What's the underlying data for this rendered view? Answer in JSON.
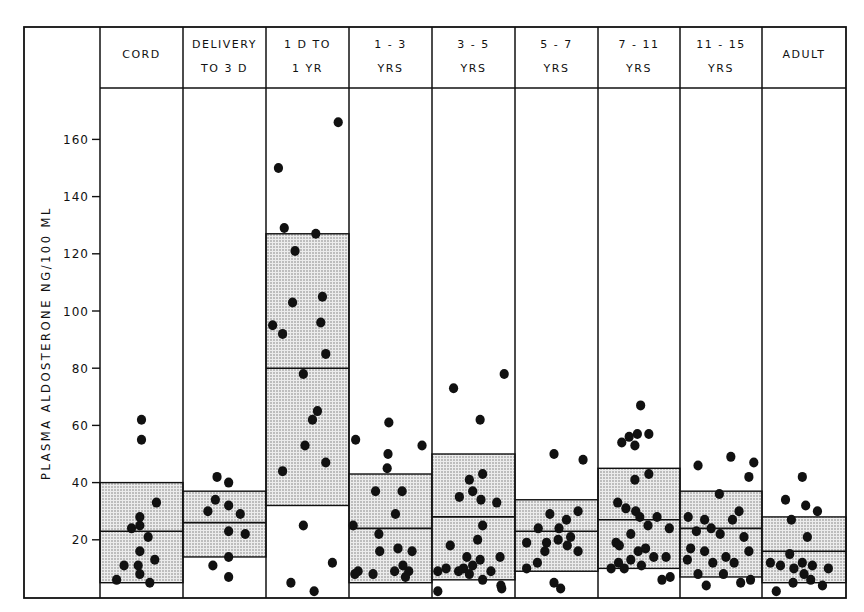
{
  "chart_data": {
    "type": "scatter",
    "title": "",
    "xlabel": "",
    "ylabel": "PLASMA  ALDOSTERONE  NG/100 ML",
    "ylim": [
      0,
      175
    ],
    "yticks": [
      20,
      40,
      60,
      80,
      100,
      120,
      140,
      160
    ],
    "grid": false,
    "legend": null,
    "categories": [
      {
        "line1": "CORD",
        "line2": ""
      },
      {
        "line1": "DELIVERY",
        "line2": "TO 3 D"
      },
      {
        "line1": "1 D  TO",
        "line2": "1 YR"
      },
      {
        "line1": "1 - 3",
        "line2": "YRS"
      },
      {
        "line1": "3 - 5",
        "line2": "YRS"
      },
      {
        "line1": "5 - 7",
        "line2": "YRS"
      },
      {
        "line1": "7 - 11",
        "line2": "YRS"
      },
      {
        "line1": "11 - 15",
        "line2": "YRS"
      },
      {
        "line1": "ADULT",
        "line2": ""
      }
    ],
    "bands": [
      {
        "group": "CORD",
        "mean": 23,
        "upper": 40,
        "lower": 5
      },
      {
        "group": "DELIVERY TO 3 D",
        "mean": 26,
        "upper": 37,
        "lower": 14
      },
      {
        "group": "1 D TO 1 YR",
        "mean": 80,
        "upper": 127,
        "lower": 32
      },
      {
        "group": "1-3 YRS",
        "mean": 24,
        "upper": 43,
        "lower": 5
      },
      {
        "group": "3-5 YRS",
        "mean": 28,
        "upper": 50,
        "lower": 6
      },
      {
        "group": "5-7 YRS",
        "mean": 23,
        "upper": 34,
        "lower": 9
      },
      {
        "group": "7-11 YRS",
        "mean": 27,
        "upper": 45,
        "lower": 10
      },
      {
        "group": "11-15 YRS",
        "mean": 24,
        "upper": 37,
        "lower": 7
      },
      {
        "group": "ADULT",
        "mean": 16,
        "upper": 28,
        "lower": 5
      }
    ],
    "series": [
      {
        "name": "CORD",
        "points": [
          [
            0.5,
            62
          ],
          [
            0.5,
            55
          ],
          [
            0.68,
            33
          ],
          [
            0.38,
            24
          ],
          [
            0.48,
            25
          ],
          [
            0.48,
            28
          ],
          [
            0.58,
            21
          ],
          [
            0.48,
            16
          ],
          [
            0.66,
            13
          ],
          [
            0.46,
            11
          ],
          [
            0.29,
            11
          ],
          [
            0.48,
            8
          ],
          [
            0.2,
            6
          ],
          [
            0.6,
            5
          ]
        ]
      },
      {
        "name": "DELIVERY TO 3 D",
        "points": [
          [
            0.41,
            42
          ],
          [
            0.55,
            40
          ],
          [
            0.39,
            34
          ],
          [
            0.55,
            32
          ],
          [
            0.3,
            30
          ],
          [
            0.69,
            29
          ],
          [
            0.55,
            23
          ],
          [
            0.75,
            22
          ],
          [
            0.55,
            14
          ],
          [
            0.36,
            11
          ],
          [
            0.55,
            7
          ]
        ]
      },
      {
        "name": "1 D TO 1 YR",
        "points": [
          [
            0.87,
            166
          ],
          [
            0.15,
            150
          ],
          [
            0.22,
            129
          ],
          [
            0.6,
            127
          ],
          [
            0.35,
            121
          ],
          [
            0.68,
            105
          ],
          [
            0.32,
            103
          ],
          [
            0.08,
            95
          ],
          [
            0.2,
            92
          ],
          [
            0.66,
            96
          ],
          [
            0.72,
            85
          ],
          [
            0.45,
            78
          ],
          [
            0.62,
            65
          ],
          [
            0.56,
            62
          ],
          [
            0.47,
            53
          ],
          [
            0.72,
            47
          ],
          [
            0.2,
            44
          ],
          [
            0.45,
            25
          ],
          [
            0.8,
            12
          ],
          [
            0.3,
            5
          ],
          [
            0.58,
            2
          ]
        ]
      },
      {
        "name": "1-3 YRS",
        "points": [
          [
            0.48,
            61
          ],
          [
            0.08,
            55
          ],
          [
            0.88,
            53
          ],
          [
            0.47,
            50
          ],
          [
            0.46,
            45
          ],
          [
            0.32,
            37
          ],
          [
            0.64,
            37
          ],
          [
            0.56,
            29
          ],
          [
            0.05,
            25
          ],
          [
            0.36,
            22
          ],
          [
            0.37,
            16
          ],
          [
            0.59,
            17
          ],
          [
            0.76,
            16
          ],
          [
            0.11,
            9
          ],
          [
            0.29,
            8
          ],
          [
            0.55,
            9
          ],
          [
            0.65,
            11
          ],
          [
            0.72,
            9
          ],
          [
            0.68,
            7
          ],
          [
            0.07,
            8
          ]
        ]
      },
      {
        "name": "3-5 YRS",
        "points": [
          [
            0.87,
            78
          ],
          [
            0.26,
            73
          ],
          [
            0.58,
            62
          ],
          [
            0.61,
            43
          ],
          [
            0.45,
            41
          ],
          [
            0.49,
            37
          ],
          [
            0.33,
            35
          ],
          [
            0.59,
            34
          ],
          [
            0.78,
            33
          ],
          [
            0.61,
            25
          ],
          [
            0.55,
            20
          ],
          [
            0.22,
            18
          ],
          [
            0.42,
            14
          ],
          [
            0.82,
            14
          ],
          [
            0.38,
            10
          ],
          [
            0.49,
            11
          ],
          [
            0.58,
            13
          ],
          [
            0.71,
            9
          ],
          [
            0.07,
            9
          ],
          [
            0.17,
            10
          ],
          [
            0.32,
            9
          ],
          [
            0.45,
            8
          ],
          [
            0.61,
            6
          ],
          [
            0.83,
            4
          ],
          [
            0.07,
            2
          ],
          [
            0.84,
            3
          ]
        ]
      },
      {
        "name": "5-7 YRS",
        "points": [
          [
            0.47,
            50
          ],
          [
            0.82,
            48
          ],
          [
            0.76,
            30
          ],
          [
            0.42,
            29
          ],
          [
            0.62,
            27
          ],
          [
            0.28,
            24
          ],
          [
            0.53,
            24
          ],
          [
            0.67,
            21
          ],
          [
            0.14,
            19
          ],
          [
            0.38,
            19
          ],
          [
            0.52,
            20
          ],
          [
            0.63,
            18
          ],
          [
            0.76,
            16
          ],
          [
            0.36,
            16
          ],
          [
            0.27,
            12
          ],
          [
            0.14,
            10
          ],
          [
            0.47,
            5
          ],
          [
            0.55,
            3
          ]
        ]
      },
      {
        "name": "7-11 YRS",
        "points": [
          [
            0.52,
            67
          ],
          [
            0.48,
            57
          ],
          [
            0.62,
            57
          ],
          [
            0.29,
            54
          ],
          [
            0.38,
            56
          ],
          [
            0.45,
            53
          ],
          [
            0.45,
            41
          ],
          [
            0.62,
            43
          ],
          [
            0.24,
            33
          ],
          [
            0.34,
            31
          ],
          [
            0.46,
            30
          ],
          [
            0.51,
            28
          ],
          [
            0.72,
            28
          ],
          [
            0.61,
            25
          ],
          [
            0.87,
            24
          ],
          [
            0.4,
            22
          ],
          [
            0.22,
            19
          ],
          [
            0.26,
            18
          ],
          [
            0.49,
            16
          ],
          [
            0.58,
            17
          ],
          [
            0.68,
            14
          ],
          [
            0.4,
            13
          ],
          [
            0.83,
            14
          ],
          [
            0.25,
            12
          ],
          [
            0.53,
            11
          ],
          [
            0.16,
            10
          ],
          [
            0.32,
            10
          ],
          [
            0.78,
            6
          ],
          [
            0.88,
            7
          ]
        ]
      },
      {
        "name": "11-15 YRS",
        "points": [
          [
            0.22,
            46
          ],
          [
            0.62,
            49
          ],
          [
            0.9,
            47
          ],
          [
            0.84,
            42
          ],
          [
            0.48,
            36
          ],
          [
            0.72,
            30
          ],
          [
            0.1,
            28
          ],
          [
            0.3,
            27
          ],
          [
            0.64,
            27
          ],
          [
            0.2,
            23
          ],
          [
            0.38,
            24
          ],
          [
            0.49,
            22
          ],
          [
            0.78,
            21
          ],
          [
            0.13,
            17
          ],
          [
            0.3,
            16
          ],
          [
            0.56,
            14
          ],
          [
            0.84,
            16
          ],
          [
            0.09,
            13
          ],
          [
            0.4,
            12
          ],
          [
            0.66,
            12
          ],
          [
            0.22,
            8
          ],
          [
            0.53,
            8
          ],
          [
            0.32,
            4
          ],
          [
            0.74,
            5
          ],
          [
            0.86,
            6
          ]
        ]
      },
      {
        "name": "ADULT",
        "points": [
          [
            0.48,
            42
          ],
          [
            0.28,
            34
          ],
          [
            0.52,
            32
          ],
          [
            0.66,
            30
          ],
          [
            0.35,
            27
          ],
          [
            0.54,
            21
          ],
          [
            0.33,
            15
          ],
          [
            0.1,
            12
          ],
          [
            0.22,
            11
          ],
          [
            0.48,
            12
          ],
          [
            0.6,
            11
          ],
          [
            0.79,
            10
          ],
          [
            0.38,
            10
          ],
          [
            0.5,
            8
          ],
          [
            0.37,
            5
          ],
          [
            0.58,
            6
          ],
          [
            0.72,
            4
          ],
          [
            0.17,
            2
          ]
        ]
      }
    ]
  },
  "colors": {
    "ink": "#111111",
    "band_fill": "#d6d6d6",
    "background": "#ffffff"
  }
}
